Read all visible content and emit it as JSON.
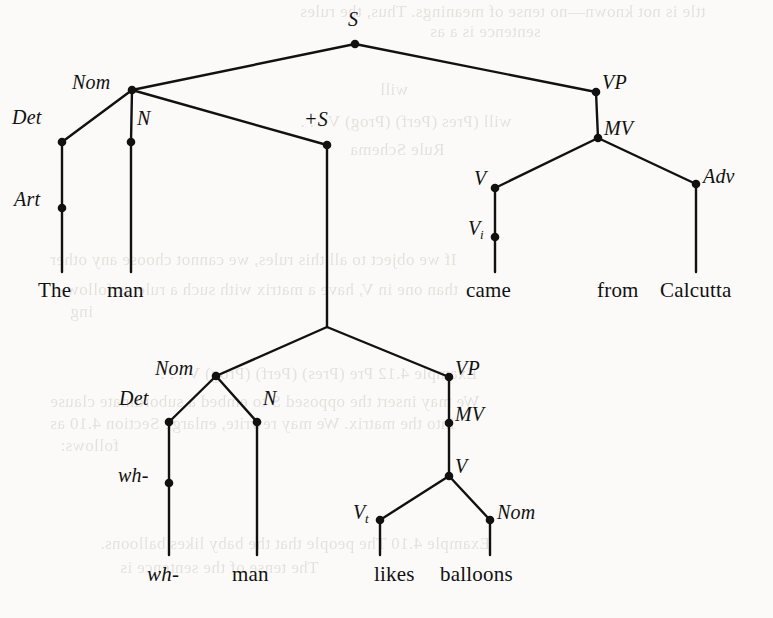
{
  "figure": {
    "kind": "phrase-structure-tree",
    "matrix_sentence": "The man came from Calcutta",
    "embedded_sentence": "wh- man likes balloons",
    "ink_color": "#111111",
    "page_color": "#fbfaf8"
  },
  "nodes": {
    "s_top": {
      "label": "S",
      "x": 355,
      "y": 44,
      "lx": 348,
      "ly": 8,
      "dot": true
    },
    "nom_top": {
      "label": "Nom",
      "x": 132,
      "y": 90,
      "lx": 72,
      "ly": 71,
      "dot": true
    },
    "vp_top": {
      "label": "VP",
      "x": 596,
      "y": 92,
      "lx": 602,
      "ly": 71,
      "dot": true
    },
    "det_top": {
      "label": "Det",
      "x": 62,
      "y": 142,
      "lx": 12,
      "ly": 106,
      "dot": true
    },
    "n_top": {
      "label": "N",
      "x": 131,
      "y": 142,
      "lx": 137,
      "ly": 107,
      "dot": true
    },
    "plus_s": {
      "label": "+S",
      "x": 327,
      "y": 145,
      "lx": 304,
      "ly": 108,
      "dot": true
    },
    "mv_top": {
      "label": "MV",
      "x": 598,
      "y": 138,
      "lx": 604,
      "ly": 117,
      "dot": true
    },
    "art_top": {
      "label": "Art",
      "x": 62,
      "y": 208,
      "lx": 14,
      "ly": 188,
      "dot": true
    },
    "v_top": {
      "label": "V",
      "x": 495,
      "y": 188,
      "lx": 474,
      "ly": 167,
      "dot": true
    },
    "adv_top": {
      "label": "Adv",
      "x": 696,
      "y": 184,
      "lx": 703,
      "ly": 165,
      "dot": true
    },
    "vi_top": {
      "label": "V",
      "sub": "i",
      "x": 495,
      "y": 237,
      "lx": 468,
      "ly": 217,
      "dot": true
    },
    "s_emb": {
      "label": "",
      "x": 327,
      "y": 327,
      "lx": 0,
      "ly": 0,
      "dot": false
    },
    "nom_emb": {
      "label": "Nom",
      "x": 216,
      "y": 376,
      "lx": 155,
      "ly": 357,
      "dot": true
    },
    "vp_emb": {
      "label": "VP",
      "x": 449,
      "y": 377,
      "lx": 455,
      "ly": 357,
      "dot": true
    },
    "det_emb": {
      "label": "Det",
      "x": 169,
      "y": 422,
      "lx": 119,
      "ly": 387,
      "dot": true
    },
    "n_emb": {
      "label": "N",
      "x": 257,
      "y": 422,
      "lx": 263,
      "ly": 387,
      "dot": true
    },
    "mv_emb": {
      "label": "MV",
      "x": 449,
      "y": 423,
      "lx": 455,
      "ly": 403,
      "dot": true
    },
    "v_emb": {
      "label": "V",
      "x": 449,
      "y": 476,
      "lx": 455,
      "ly": 455,
      "dot": true
    },
    "wh_det": {
      "label": "wh-",
      "x": 169,
      "y": 483,
      "lx": 118,
      "ly": 464,
      "dot": true
    },
    "vt_emb": {
      "label": "V",
      "sub": "t",
      "x": 380,
      "y": 520,
      "lx": 353,
      "ly": 501,
      "dot": true
    },
    "nom_obj": {
      "label": "Nom",
      "x": 490,
      "y": 520,
      "lx": 497,
      "ly": 501,
      "dot": true
    }
  },
  "edges": [
    [
      "s_top",
      "nom_top"
    ],
    [
      "s_top",
      "vp_top"
    ],
    [
      "nom_top",
      "det_top"
    ],
    [
      "nom_top",
      "n_top"
    ],
    [
      "nom_top",
      "plus_s"
    ],
    [
      "vp_top",
      "mv_top"
    ],
    [
      "mv_top",
      "v_top"
    ],
    [
      "mv_top",
      "adv_top"
    ],
    [
      "det_top",
      "art_top"
    ],
    [
      "v_top",
      "vi_top"
    ],
    [
      "plus_s",
      "s_emb"
    ],
    [
      "s_emb",
      "nom_emb"
    ],
    [
      "s_emb",
      "vp_emb"
    ],
    [
      "nom_emb",
      "det_emb"
    ],
    [
      "nom_emb",
      "n_emb"
    ],
    [
      "vp_emb",
      "mv_emb"
    ],
    [
      "mv_emb",
      "v_emb"
    ],
    [
      "v_emb",
      "vt_emb"
    ],
    [
      "v_emb",
      "nom_obj"
    ],
    [
      "det_emb",
      "wh_det"
    ]
  ],
  "stems": [
    {
      "from": "art_top",
      "to_y": 272
    },
    {
      "from": "n_top",
      "to_y": 272
    },
    {
      "from": "vi_top",
      "to_y": 272
    },
    {
      "from": "adv_top",
      "to_y": 272
    },
    {
      "from": "wh_det",
      "to_y": 555
    },
    {
      "from": "n_emb",
      "to_y": 555
    },
    {
      "from": "vt_emb",
      "to_y": 555
    },
    {
      "from": "nom_obj",
      "to_y": 555
    }
  ],
  "words": [
    {
      "text": "The",
      "x": 38,
      "y": 278,
      "italic": false
    },
    {
      "text": "man",
      "x": 107,
      "y": 278,
      "italic": false
    },
    {
      "text": "came",
      "x": 466,
      "y": 278,
      "italic": false
    },
    {
      "text": "from",
      "x": 597,
      "y": 278,
      "italic": false
    },
    {
      "text": "Calcutta",
      "x": 660,
      "y": 278,
      "italic": false
    },
    {
      "text": "wh-",
      "x": 147,
      "y": 562,
      "italic": true
    },
    {
      "text": "man",
      "x": 232,
      "y": 562,
      "italic": false
    },
    {
      "text": "likes",
      "x": 374,
      "y": 562,
      "italic": false
    },
    {
      "text": "balloons",
      "x": 440,
      "y": 562,
      "italic": false
    }
  ],
  "ghost_text": [
    {
      "text": "ttle is not known—no tense of meanings. Thus, the rules",
      "x": 300,
      "y": 2
    },
    {
      "text": "sentence is a as",
      "x": 430,
      "y": 22
    },
    {
      "text": "will",
      "x": 380,
      "y": 80
    },
    {
      "text": "will  (Pres  (Perf)  (Prog)  V . . .",
      "x": 300,
      "y": 112
    },
    {
      "text": "Rule Schema",
      "x": 350,
      "y": 140
    },
    {
      "text": "If we object to all this rules, we cannot choose any other",
      "x": 50,
      "y": 250
    },
    {
      "text": "than one in  V, have a matrix with such a rule as follow-",
      "x": 60,
      "y": 280
    },
    {
      "text": "ing",
      "x": 70,
      "y": 302
    },
    {
      "text": "Example 4.12   Pre  (Pres)  (Perf)  (Prog)  V . . .",
      "x": 160,
      "y": 364
    },
    {
      "text": "We may insert the opposed S to embed a subordinate clause",
      "x": 50,
      "y": 392
    },
    {
      "text": "into the matrix. We may rewrite, enlarge Section 4.10 as",
      "x": 50,
      "y": 414
    },
    {
      "text": "follows:",
      "x": 60,
      "y": 436
    },
    {
      "text": "Example 4.10     The people that the baby likes balloons.",
      "x": 100,
      "y": 534
    },
    {
      "text": "The tense of the sentence is",
      "x": 120,
      "y": 558
    }
  ]
}
